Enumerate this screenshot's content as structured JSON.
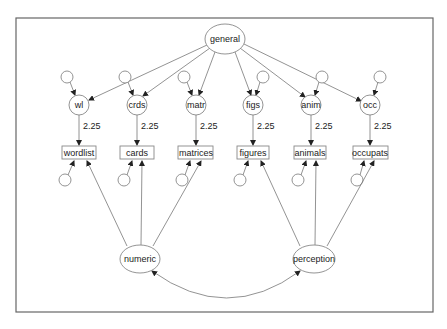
{
  "diagram": {
    "type": "path-diagram",
    "latent_top": {
      "id": "general",
      "label": "general"
    },
    "first_order": [
      {
        "id": "wl",
        "label": "wl",
        "indicator": "wordlist",
        "loading": "2.25"
      },
      {
        "id": "crds",
        "label": "crds",
        "indicator": "cards",
        "loading": "2.25"
      },
      {
        "id": "matr",
        "label": "matr",
        "indicator": "matrices",
        "loading": "2.25"
      },
      {
        "id": "figs",
        "label": "figs",
        "indicator": "figures",
        "loading": "2.25"
      },
      {
        "id": "anim",
        "label": "anim",
        "indicator": "animals",
        "loading": "2.25"
      },
      {
        "id": "occ",
        "label": "occ",
        "indicator": "occupats",
        "loading": "2.25"
      }
    ],
    "latent_bottom": [
      {
        "id": "numeric",
        "label": "numeric",
        "indicators": [
          "wordlist",
          "cards",
          "matrices"
        ]
      },
      {
        "id": "perception",
        "label": "perception",
        "indicators": [
          "figures",
          "animals",
          "occupats"
        ]
      }
    ],
    "covariance": [
      "numeric",
      "perception"
    ]
  }
}
